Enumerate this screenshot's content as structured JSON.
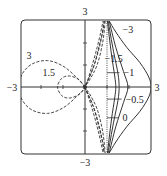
{
  "chart_data": {
    "type": "line",
    "title": "",
    "xlabel": "",
    "ylabel": "",
    "xlim": [
      -3,
      3
    ],
    "ylim": [
      -3,
      3
    ],
    "grid": false,
    "legend": "inline labels",
    "axis_labels": {
      "left": "−3",
      "right": "3",
      "top": "3",
      "bottom": "−3"
    },
    "ticks": {
      "x": [
        -2,
        -1,
        1,
        2
      ],
      "y": [
        -2,
        -1,
        1,
        2
      ]
    },
    "series": [
      {
        "name": "3",
        "style": "dashed",
        "label_pos": [
          -2.55,
          1.45
        ],
        "points": [
          [
            0,
            0
          ],
          [
            -0.4,
            0.45
          ],
          [
            -1.0,
            0.95
          ],
          [
            -1.7,
            1.2
          ],
          [
            -2.4,
            1.05
          ],
          [
            -2.85,
            0.6
          ],
          [
            -3.0,
            0
          ],
          [
            -2.85,
            -0.6
          ],
          [
            -2.4,
            -1.05
          ],
          [
            -1.7,
            -1.2
          ],
          [
            -1.0,
            -0.95
          ],
          [
            -0.4,
            -0.45
          ],
          [
            0,
            0
          ],
          [
            0.3,
            0.9
          ],
          [
            0.55,
            1.8
          ],
          [
            0.72,
            2.5
          ],
          [
            0.82,
            3.0
          ]
        ],
        "tail": [
          [
            0,
            0
          ],
          [
            0.3,
            -0.9
          ],
          [
            0.55,
            -1.8
          ],
          [
            0.72,
            -2.5
          ],
          [
            0.82,
            -3.0
          ]
        ]
      },
      {
        "name": "1.5",
        "style": "dashed",
        "label_pos": [
          -1.65,
          0.65
        ],
        "points": [
          [
            0,
            0
          ],
          [
            -0.3,
            0.35
          ],
          [
            -0.7,
            0.5
          ],
          [
            -1.05,
            0.4
          ],
          [
            -1.25,
            0
          ],
          [
            -1.05,
            -0.4
          ],
          [
            -0.7,
            -0.5
          ],
          [
            -0.3,
            -0.35
          ],
          [
            0,
            0
          ],
          [
            0.4,
            0.95
          ],
          [
            0.65,
            1.9
          ],
          [
            0.8,
            2.5
          ],
          [
            0.87,
            3.0
          ]
        ],
        "tail": [
          [
            0,
            0
          ],
          [
            0.4,
            -0.95
          ],
          [
            0.65,
            -1.9
          ],
          [
            0.8,
            -2.5
          ],
          [
            0.87,
            -3.0
          ]
        ]
      },
      {
        "name": "0.5",
        "style": "dashed",
        "points": [
          [
            0.92,
            3.0
          ],
          [
            0.8,
            2.0
          ],
          [
            0.55,
            1.0
          ],
          [
            0.2,
            0.3
          ],
          [
            0,
            0
          ],
          [
            0.2,
            -0.3
          ],
          [
            0.55,
            -1.0
          ],
          [
            0.8,
            -2.0
          ],
          [
            0.92,
            -3.0
          ]
        ]
      },
      {
        "name": "1",
        "style": "dashed",
        "points": [
          [
            0.88,
            3.0
          ],
          [
            0.7,
            2.0
          ],
          [
            0.42,
            1.0
          ],
          [
            0.15,
            0.35
          ],
          [
            0,
            0
          ],
          [
            0.15,
            -0.35
          ],
          [
            0.42,
            -1.0
          ],
          [
            0.7,
            -2.0
          ],
          [
            0.88,
            -3.0
          ]
        ]
      },
      {
        "name": "0",
        "style": "dotted",
        "points": [
          [
            1.0,
            3.0
          ],
          [
            1.0,
            -3.0
          ]
        ]
      },
      {
        "name": "−0.5",
        "style": "solid",
        "points": [
          [
            1.02,
            3.0
          ],
          [
            1.2,
            1.5
          ],
          [
            1.35,
            0.5
          ],
          [
            1.4,
            0
          ],
          [
            1.35,
            -0.5
          ],
          [
            1.2,
            -1.5
          ],
          [
            1.02,
            -3.0
          ]
        ]
      },
      {
        "name": "−1",
        "style": "solid",
        "points": [
          [
            1.05,
            3.0
          ],
          [
            1.3,
            1.6
          ],
          [
            1.5,
            0.6
          ],
          [
            1.55,
            0
          ],
          [
            1.5,
            -0.6
          ],
          [
            1.3,
            -1.6
          ],
          [
            1.05,
            -3.0
          ]
        ]
      },
      {
        "name": "−1.5",
        "style": "solid",
        "points": [
          [
            1.1,
            3.0
          ],
          [
            1.4,
            1.8
          ],
          [
            1.75,
            0.7
          ],
          [
            1.95,
            0
          ],
          [
            1.75,
            -0.7
          ],
          [
            1.4,
            -1.8
          ],
          [
            1.1,
            -3.0
          ]
        ]
      },
      {
        "name": "−3",
        "style": "solid",
        "points": [
          [
            1.1,
            3.0
          ],
          [
            1.4,
            2.5
          ],
          [
            1.9,
            1.8
          ],
          [
            2.5,
            1.1
          ],
          [
            2.9,
            0.45
          ],
          [
            3.0,
            0
          ],
          [
            2.9,
            -0.45
          ],
          [
            2.5,
            -1.1
          ],
          [
            1.9,
            -1.8
          ],
          [
            1.4,
            -2.5
          ],
          [
            1.1,
            -3.0
          ]
        ]
      }
    ],
    "annotations": [
      {
        "text": "−3",
        "pos": [
          1.95,
          2.6
        ]
      },
      {
        "text": "−1.5",
        "pos": [
          1.3,
          1.3
        ]
      },
      {
        "text": "−1",
        "pos": [
          1.75,
          0.65
        ],
        "leader_to": [
          1.0,
          0.65
        ]
      },
      {
        "text": "−0.5",
        "pos": [
          1.85,
          -0.55
        ],
        "leader_to": [
          1.0,
          -0.55
        ]
      },
      {
        "text": "0",
        "pos": [
          1.7,
          -1.4
        ],
        "leader_to": [
          1.0,
          -1.4
        ]
      },
      {
        "text": "3",
        "pos": [
          -2.55,
          1.45
        ]
      },
      {
        "text": "1.5",
        "pos": [
          -1.65,
          0.65
        ]
      }
    ]
  }
}
